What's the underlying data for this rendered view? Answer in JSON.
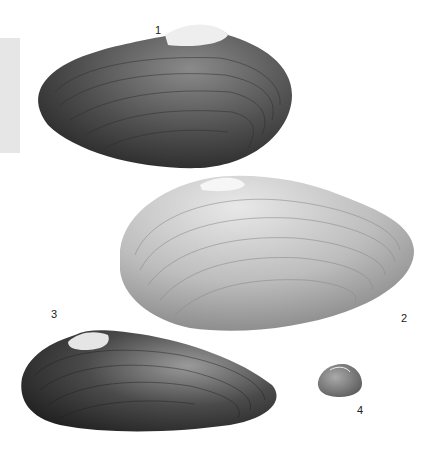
{
  "plate": {
    "description": "Scientific illustration plate of four bivalve (freshwater mussel) shells",
    "background": "#ffffff",
    "side_tab_color": "#e6e6e6",
    "figures": [
      {
        "number": "1",
        "shade": "dark",
        "color": "#4a4a4a"
      },
      {
        "number": "2",
        "shade": "light",
        "color": "#b8b8b8"
      },
      {
        "number": "3",
        "shade": "dark",
        "color": "#3a3a3a"
      },
      {
        "number": "4",
        "shade": "small-medium",
        "color": "#7a7a7a"
      }
    ]
  }
}
